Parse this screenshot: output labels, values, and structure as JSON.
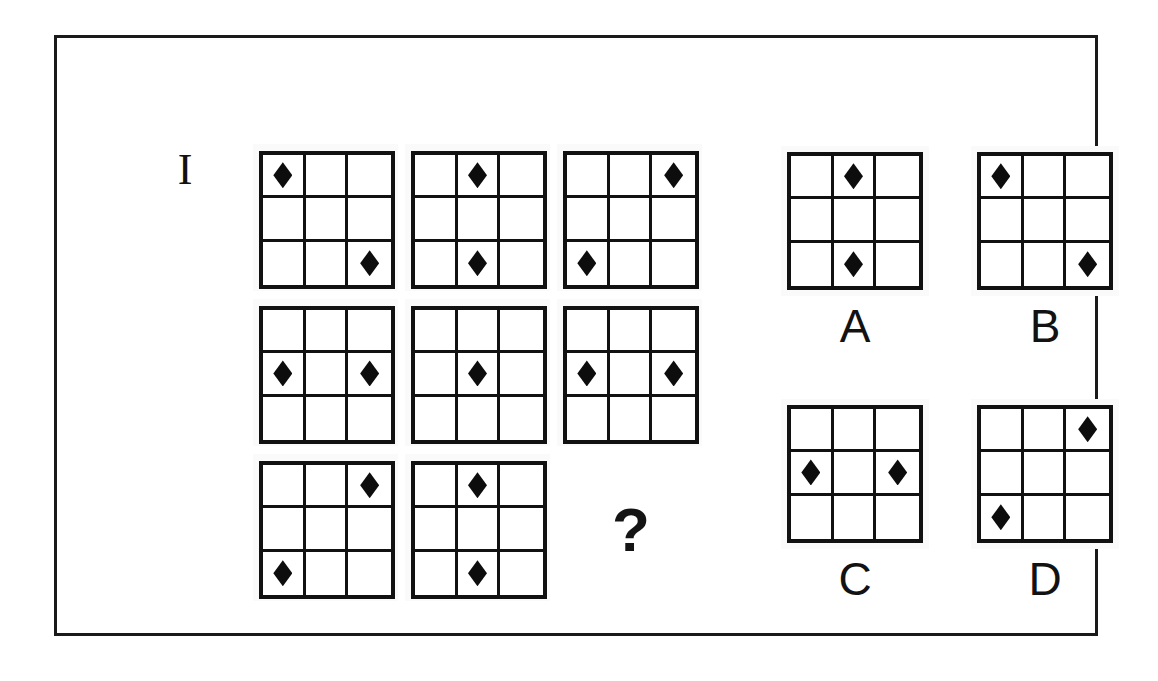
{
  "item": {
    "number_label": "I",
    "missing_marker": "?"
  },
  "grid": {
    "rows": 3,
    "columns": 3,
    "symbol": "diamond",
    "symbol_color": "#0d0d0d",
    "line_color": "#111111",
    "background_color": "#ffffff"
  },
  "frame": {
    "border_color": "#1a1a1a"
  },
  "matrix": {
    "cells": [
      {
        "name": "matrix-cell-1",
        "position": "row1-col1",
        "is_missing": false,
        "filled": [
          [
            0,
            0
          ],
          [
            2,
            2
          ]
        ]
      },
      {
        "name": "matrix-cell-2",
        "position": "row1-col2",
        "is_missing": false,
        "filled": [
          [
            0,
            1
          ],
          [
            2,
            1
          ]
        ]
      },
      {
        "name": "matrix-cell-3",
        "position": "row1-col3",
        "is_missing": false,
        "filled": [
          [
            0,
            2
          ],
          [
            2,
            0
          ]
        ]
      },
      {
        "name": "matrix-cell-4",
        "position": "row2-col1",
        "is_missing": false,
        "filled": [
          [
            1,
            0
          ],
          [
            1,
            2
          ]
        ]
      },
      {
        "name": "matrix-cell-5",
        "position": "row2-col2",
        "is_missing": false,
        "filled": [
          [
            1,
            1
          ]
        ]
      },
      {
        "name": "matrix-cell-6",
        "position": "row2-col3",
        "is_missing": false,
        "filled": [
          [
            1,
            0
          ],
          [
            1,
            2
          ]
        ]
      },
      {
        "name": "matrix-cell-7",
        "position": "row3-col1",
        "is_missing": false,
        "filled": [
          [
            0,
            2
          ],
          [
            2,
            0
          ]
        ]
      },
      {
        "name": "matrix-cell-8",
        "position": "row3-col2",
        "is_missing": false,
        "filled": [
          [
            0,
            1
          ],
          [
            2,
            1
          ]
        ]
      },
      {
        "name": "matrix-cell-9",
        "position": "row3-col3",
        "is_missing": true,
        "filled": []
      }
    ]
  },
  "options": [
    {
      "name": "option-a",
      "label": "A",
      "filled": [
        [
          0,
          1
        ],
        [
          2,
          1
        ]
      ]
    },
    {
      "name": "option-b",
      "label": "B",
      "filled": [
        [
          0,
          0
        ],
        [
          2,
          2
        ]
      ]
    },
    {
      "name": "option-c",
      "label": "C",
      "filled": [
        [
          1,
          0
        ],
        [
          1,
          2
        ]
      ]
    },
    {
      "name": "option-d",
      "label": "D",
      "filled": [
        [
          0,
          2
        ],
        [
          2,
          0
        ]
      ]
    }
  ]
}
